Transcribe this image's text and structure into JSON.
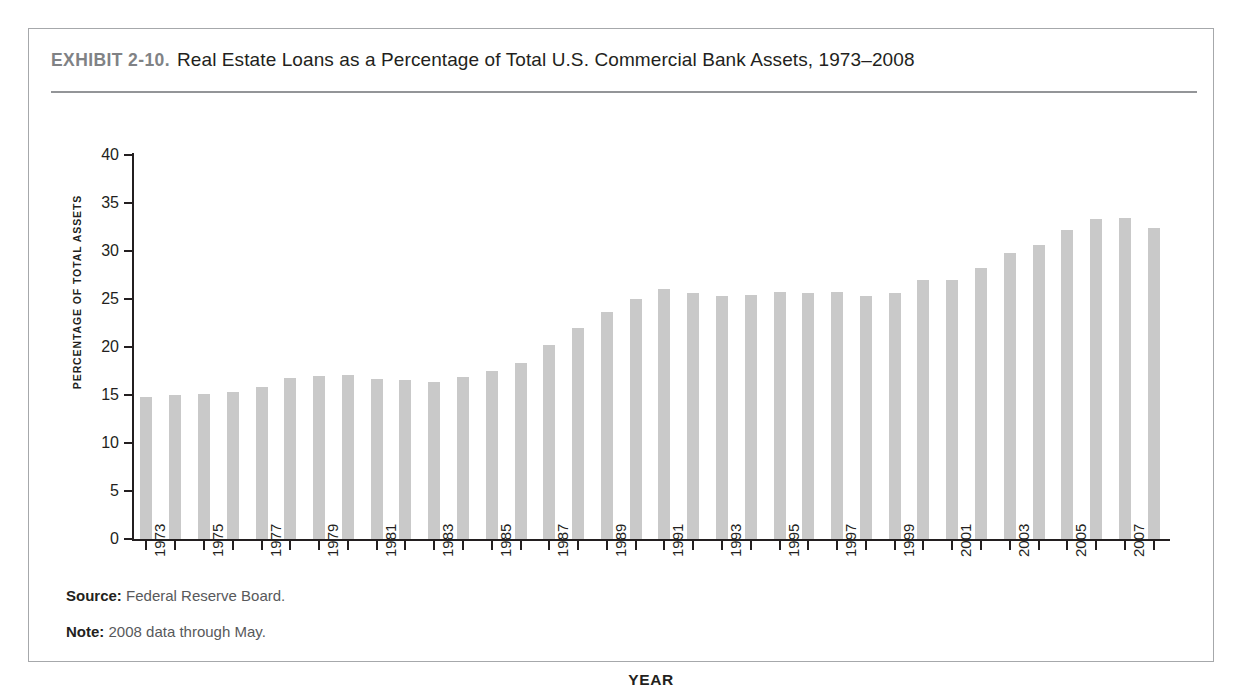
{
  "exhibit": {
    "label": "EXHIBIT 2-10.",
    "title": "Real Estate Loans as a Percentage of Total U.S. Commercial Bank Assets, 1973–2008"
  },
  "footnotes": {
    "source_label": "Source:",
    "source_text": "Federal Reserve Board.",
    "note_label": "Note:",
    "note_text": "2008 data through May."
  },
  "colors": {
    "bar": "#c9c9c9",
    "axis": "#231f20",
    "rule": "#939598",
    "frame": "#a6a8ab",
    "exhibit_label": "#808285"
  },
  "chart_data": {
    "type": "bar",
    "title": "Real Estate Loans as a Percentage of Total U.S. Commercial Bank Assets, 1973–2008",
    "xlabel": "YEAR",
    "ylabel": "PERCENTAGE OF TOTAL ASSETS",
    "ylim": [
      0,
      40
    ],
    "yticks": [
      0,
      5,
      10,
      15,
      20,
      25,
      30,
      35,
      40
    ],
    "ytick_labels": [
      "0",
      "5",
      "10",
      "15",
      "20",
      "25",
      "30",
      "35",
      "40"
    ],
    "grid": false,
    "legend": false,
    "categories": [
      "1973",
      "1974",
      "1975",
      "1976",
      "1977",
      "1978",
      "1979",
      "1980",
      "1981",
      "1982",
      "1983",
      "1984",
      "1985",
      "1986",
      "1987",
      "1988",
      "1989",
      "1990",
      "1991",
      "1992",
      "1993",
      "1994",
      "1995",
      "1996",
      "1997",
      "1998",
      "1999",
      "2000",
      "2001",
      "2002",
      "2003",
      "2004",
      "2005",
      "2006",
      "2007",
      "2008"
    ],
    "xtick_labels": [
      "1973",
      "",
      "1975",
      "",
      "1977",
      "",
      "1979",
      "",
      "1981",
      "",
      "1983",
      "",
      "1985",
      "",
      "1987",
      "",
      "1989",
      "",
      "1991",
      "",
      "1993",
      "",
      "1995",
      "",
      "1997",
      "",
      "1999",
      "",
      "2001",
      "",
      "2003",
      "",
      "2005",
      "",
      "2007",
      ""
    ],
    "values": [
      14.8,
      15.0,
      15.1,
      15.3,
      15.8,
      16.8,
      17.0,
      17.1,
      16.7,
      16.6,
      16.4,
      16.9,
      17.5,
      18.3,
      20.2,
      22.0,
      23.6,
      25.0,
      26.0,
      25.6,
      25.3,
      25.4,
      25.7,
      25.6,
      25.7,
      25.3,
      25.6,
      27.0,
      27.0,
      28.2,
      29.8,
      30.6,
      32.2,
      33.3,
      33.4,
      32.4
    ]
  }
}
